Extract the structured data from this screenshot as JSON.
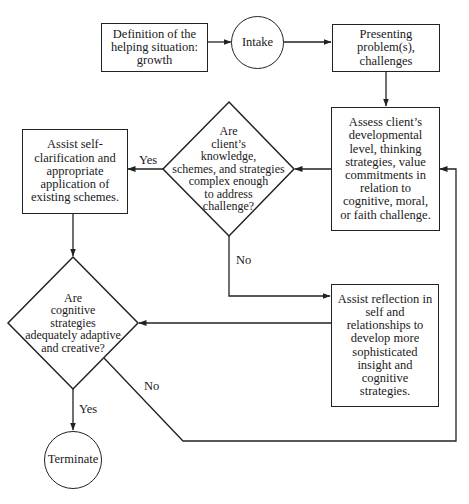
{
  "diagram": {
    "type": "flowchart",
    "nodes": {
      "definition": {
        "shape": "rectangle",
        "text": "Definition of the\nhelping situation:\ngrowth"
      },
      "intake": {
        "shape": "circle",
        "text": "Intake"
      },
      "presenting": {
        "shape": "rectangle",
        "text": "Presenting\nproblem(s),\nchallenges"
      },
      "assess": {
        "shape": "rectangle",
        "text": "Assess client’s\ndevelopmental\nlevel, thinking\nstrategies, value\ncommitments in\nrelation to\ncognitive, moral,\nor faith challenge."
      },
      "decision_complex": {
        "shape": "diamond",
        "text": "Are\nclient’s\nknowledge,\nschemes, and strategies\ncomplex enough\nto address\nchallenge?"
      },
      "assist_self": {
        "shape": "rectangle",
        "text": "Assist self-\nclarification and\nappropriate\napplication of\nexisting schemes."
      },
      "assist_reflection": {
        "shape": "rectangle",
        "text": "Assist reflection in\nself and\nrelationships to\ndevelop more\nsophisticated\ninsight and\ncognitive\nstrategies."
      },
      "decision_adaptive": {
        "shape": "diamond",
        "text": "Are\ncognitive\nstrategies\nadequately adaptive\nand creative?"
      },
      "terminate": {
        "shape": "circle",
        "text": "Terminate"
      }
    },
    "edges": [
      {
        "from": "definition",
        "to": "intake",
        "label": ""
      },
      {
        "from": "intake",
        "to": "presenting",
        "label": ""
      },
      {
        "from": "presenting",
        "to": "assess",
        "label": ""
      },
      {
        "from": "assess",
        "to": "decision_complex",
        "label": ""
      },
      {
        "from": "decision_complex",
        "to": "assist_self",
        "label": "Yes"
      },
      {
        "from": "decision_complex",
        "to": "assist_reflection",
        "label": "No"
      },
      {
        "from": "assist_self",
        "to": "decision_adaptive",
        "label": ""
      },
      {
        "from": "assist_reflection",
        "to": "decision_adaptive",
        "label": ""
      },
      {
        "from": "decision_adaptive",
        "to": "terminate",
        "label": "Yes"
      },
      {
        "from": "decision_adaptive",
        "to": "assess",
        "label": "No"
      }
    ],
    "labels": {
      "yes_complex": "Yes",
      "no_complex": "No",
      "yes_adaptive": "Yes",
      "no_adaptive": "No"
    }
  },
  "colors": {
    "stroke": "#222222",
    "background": "#ffffff",
    "text": "#1a1a1a"
  }
}
